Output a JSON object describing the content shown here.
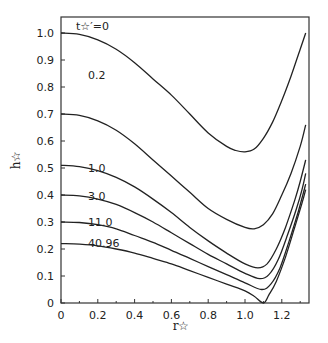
{
  "chart_data": {
    "type": "line",
    "title": "",
    "xlabel": "r☆",
    "ylabel": "h☆",
    "xlim": [
      0,
      1.34
    ],
    "ylim": [
      0,
      1.05
    ],
    "grid": false,
    "legend_position": "inline curve labels",
    "x_ticks": [
      "0",
      "0.2",
      "0.4",
      "0.6",
      "0.8",
      "1.0",
      "1.2"
    ],
    "y_ticks": [
      "0",
      "0.1",
      "0.2",
      "0.3",
      "0.4",
      "0.5",
      "0.6",
      "0.7",
      "0.8",
      "0.9",
      "1.0"
    ],
    "parameter_label": "t☆′=",
    "series": [
      {
        "name": "0",
        "label": "t☆′=0",
        "x": [
          0,
          0.1,
          0.2,
          0.3,
          0.4,
          0.5,
          0.6,
          0.7,
          0.8,
          0.9,
          0.95,
          1.0,
          1.05,
          1.1,
          1.15,
          1.2,
          1.25,
          1.3,
          1.33
        ],
        "y": [
          1.0,
          0.995,
          0.975,
          0.94,
          0.89,
          0.83,
          0.77,
          0.7,
          0.63,
          0.58,
          0.565,
          0.56,
          0.57,
          0.61,
          0.67,
          0.75,
          0.84,
          0.94,
          1.0
        ]
      },
      {
        "name": "0.2",
        "label": "0.2",
        "x": [
          0,
          0.1,
          0.2,
          0.3,
          0.4,
          0.5,
          0.6,
          0.7,
          0.8,
          0.9,
          1.0,
          1.05,
          1.1,
          1.15,
          1.2,
          1.25,
          1.3,
          1.33
        ],
        "y": [
          0.7,
          0.695,
          0.675,
          0.64,
          0.59,
          0.53,
          0.47,
          0.41,
          0.35,
          0.31,
          0.28,
          0.275,
          0.29,
          0.33,
          0.4,
          0.48,
          0.58,
          0.66
        ]
      },
      {
        "name": "1.0",
        "label": "1.0",
        "x": [
          0,
          0.1,
          0.2,
          0.3,
          0.4,
          0.5,
          0.6,
          0.7,
          0.8,
          0.9,
          1.0,
          1.07,
          1.12,
          1.17,
          1.22,
          1.27,
          1.3,
          1.33
        ],
        "y": [
          0.51,
          0.505,
          0.49,
          0.465,
          0.43,
          0.385,
          0.335,
          0.28,
          0.23,
          0.185,
          0.145,
          0.13,
          0.145,
          0.2,
          0.28,
          0.38,
          0.45,
          0.53
        ]
      },
      {
        "name": "3.0",
        "label": "3.0",
        "x": [
          0,
          0.1,
          0.2,
          0.3,
          0.4,
          0.5,
          0.6,
          0.7,
          0.8,
          0.9,
          1.0,
          1.08,
          1.13,
          1.18,
          1.23,
          1.28,
          1.31,
          1.33
        ],
        "y": [
          0.4,
          0.397,
          0.385,
          0.365,
          0.335,
          0.3,
          0.26,
          0.22,
          0.18,
          0.145,
          0.11,
          0.09,
          0.105,
          0.16,
          0.25,
          0.35,
          0.42,
          0.48
        ]
      },
      {
        "name": "11.0",
        "label": "11.0",
        "x": [
          0,
          0.1,
          0.2,
          0.3,
          0.4,
          0.5,
          0.6,
          0.7,
          0.8,
          0.9,
          1.0,
          1.09,
          1.14,
          1.19,
          1.24,
          1.29,
          1.33
        ],
        "y": [
          0.3,
          0.298,
          0.29,
          0.275,
          0.25,
          0.225,
          0.195,
          0.165,
          0.135,
          0.105,
          0.075,
          0.05,
          0.07,
          0.13,
          0.23,
          0.34,
          0.44
        ]
      },
      {
        "name": "40.96",
        "label": "40.96",
        "x": [
          0,
          0.1,
          0.2,
          0.3,
          0.4,
          0.5,
          0.6,
          0.7,
          0.8,
          0.9,
          1.0,
          1.05,
          1.1,
          1.13,
          1.17,
          1.22,
          1.27,
          1.31,
          1.33
        ],
        "y": [
          0.22,
          0.218,
          0.212,
          0.2,
          0.185,
          0.165,
          0.145,
          0.12,
          0.095,
          0.07,
          0.045,
          0.025,
          0.0,
          0.03,
          0.08,
          0.17,
          0.28,
          0.37,
          0.42
        ]
      }
    ]
  }
}
